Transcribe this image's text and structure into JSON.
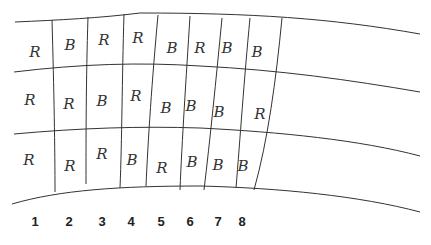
{
  "grid": {
    "rows": [
      [
        "R",
        "B",
        "R",
        "R",
        "B",
        "R",
        "B",
        "B"
      ],
      [
        "R",
        "R",
        "B",
        "R",
        "B",
        "B",
        "B",
        "R"
      ],
      [
        "R",
        "R",
        "R",
        "B",
        "R",
        "B",
        "B",
        "B"
      ]
    ]
  },
  "columns": [
    "1",
    "2",
    "3",
    "4",
    "5",
    "6",
    "7",
    "8"
  ]
}
